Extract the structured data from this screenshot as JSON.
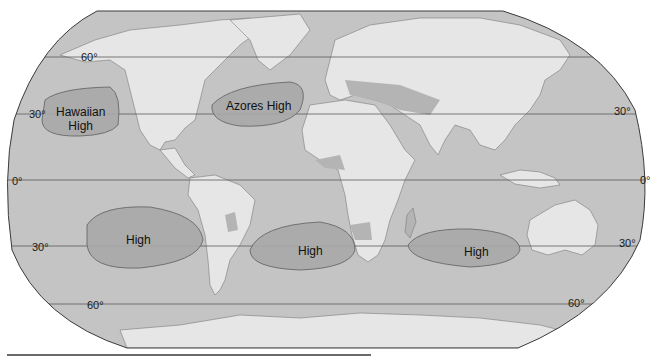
{
  "map": {
    "title": "Subtropical high pressure cells",
    "colors": {
      "ocean": "#c4c4c4",
      "land": "#e6e6e6",
      "dry_land": "#b4b4b4",
      "high_cell": "#a9a9a9",
      "lines": "#5a5a5a",
      "border": "#3c3c3c"
    },
    "latitude_labels": {
      "n60_left": "60°",
      "n30_left": "30°",
      "eq_left": "0°",
      "s30_left": "30°",
      "s60_left": "60°",
      "n30_right": "30°",
      "eq_right": "0°",
      "s30_right": "30°",
      "s60_right": "60°"
    },
    "pressure_cells": [
      {
        "name": "Hawaiian High",
        "line1": "Hawaiian",
        "line2": "High"
      },
      {
        "name": "Azores High",
        "line1": "Azores High"
      },
      {
        "name": "South Pacific High",
        "line1": "High"
      },
      {
        "name": "South Atlantic High",
        "line1": "High"
      },
      {
        "name": "Indian Ocean High",
        "line1": "High"
      }
    ]
  }
}
